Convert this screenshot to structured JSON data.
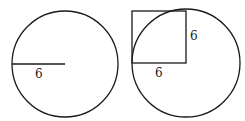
{
  "figures": [
    {
      "name": "circle-with-radius",
      "circle": {
        "cx": 65,
        "cy": 64,
        "r": 53
      },
      "radius_segment": {
        "x1": 12,
        "y1": 64,
        "x2": 65,
        "y2": 64
      },
      "labels": [
        {
          "text": "6",
          "x": 35,
          "y": 78
        }
      ]
    },
    {
      "name": "circle-with-square",
      "circle": {
        "cx": 186,
        "cy": 63,
        "r": 54
      },
      "square": {
        "x": 132,
        "y": 11,
        "w": 54,
        "h": 52
      },
      "labels": [
        {
          "text": "6",
          "x": 190,
          "y": 40
        },
        {
          "text": "6",
          "x": 155,
          "y": 77
        }
      ]
    }
  ],
  "colors": {
    "stroke": "#1a1a1a",
    "background": "#ffffff"
  }
}
